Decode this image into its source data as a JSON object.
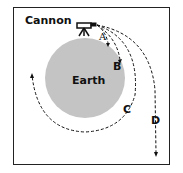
{
  "title": "Cannon",
  "planet_label": "Earth",
  "trajectories": [
    "A",
    "B",
    "C",
    "D"
  ],
  "colors": {
    "earth": "#c4c4c4",
    "line": "#111111"
  }
}
